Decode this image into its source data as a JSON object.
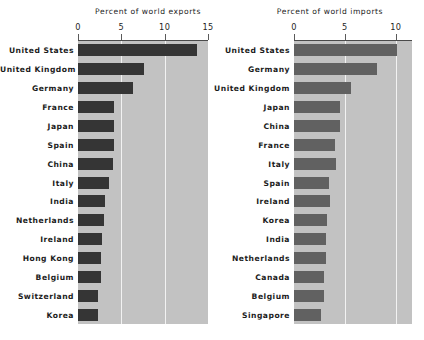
{
  "figure": {
    "background_color": "#ffffff",
    "plot_background_color": "#c2c2c2",
    "gridline_color": "#f2f2f2"
  },
  "panels": [
    {
      "id": "exports",
      "title": "Percent of world exports",
      "bar_color": "#353535",
      "tick_labels": [
        "0",
        "5",
        "10",
        "15"
      ],
      "tick_values": [
        0,
        5,
        10,
        15
      ]
    },
    {
      "id": "imports",
      "title": "Percent of world imports",
      "bar_color": "#616161",
      "tick_labels": [
        "0",
        "5",
        "10"
      ],
      "tick_values": [
        0,
        5,
        10
      ]
    }
  ],
  "chart_data": [
    {
      "type": "bar",
      "orientation": "horizontal",
      "title": "Percent of world exports",
      "xlabel": "Percent of world exports",
      "ylabel": "",
      "xlim": [
        0,
        15
      ],
      "xticks": [
        0,
        5,
        10,
        15
      ],
      "grid": true,
      "legend": "none",
      "bar_color": "#353535",
      "categories": [
        "United States",
        "United Kingdom",
        "Germany",
        "France",
        "Japan",
        "Spain",
        "China",
        "Italy",
        "India",
        "Netherlands",
        "Ireland",
        "Hong Kong",
        "Belgium",
        "Switzerland",
        "Korea"
      ],
      "values": [
        13.7,
        7.6,
        6.3,
        4.2,
        4.1,
        4.1,
        4.0,
        3.6,
        3.1,
        3.0,
        2.8,
        2.7,
        2.6,
        2.3,
        2.3
      ]
    },
    {
      "type": "bar",
      "orientation": "horizontal",
      "title": "Percent of world imports",
      "xlabel": "Percent of world imports",
      "ylabel": "",
      "xlim": [
        0,
        12
      ],
      "xticks": [
        0,
        5,
        10
      ],
      "grid": true,
      "legend": "none",
      "bar_color": "#616161",
      "categories": [
        "United States",
        "Germany",
        "United Kingdom",
        "Japan",
        "China",
        "France",
        "Italy",
        "Spain",
        "Ireland",
        "Korea",
        "India",
        "Netherlands",
        "Canada",
        "Belgium",
        "Singapore"
      ],
      "values": [
        10.1,
        8.2,
        5.6,
        4.5,
        4.5,
        4.0,
        4.1,
        3.4,
        3.5,
        3.2,
        3.1,
        3.1,
        2.9,
        2.9,
        2.7
      ]
    }
  ]
}
